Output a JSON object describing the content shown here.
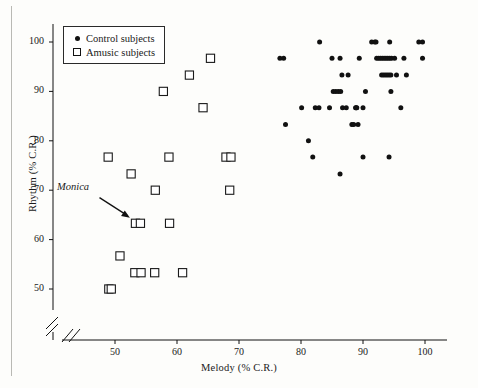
{
  "figure": {
    "background_color": "#fdfdfb",
    "ink_color": "#111111"
  },
  "legend": {
    "position": "top-left-inside",
    "entries": [
      {
        "marker": "filled-circle",
        "label": "Control subjects"
      },
      {
        "marker": "open-square",
        "label": "Amusic subjects"
      }
    ]
  },
  "annotation": {
    "text": "Monica",
    "style": "italic",
    "arrow": {
      "from_x": 47.5,
      "from_y": 68.5,
      "to_x": 52.4,
      "to_y": 64.4
    }
  },
  "chart_data": {
    "type": "scatter",
    "title": "",
    "xlabel": "Melody (% C.R.)",
    "ylabel": "Rhythm (% C.R.)",
    "xlim": [
      45.5,
      103.5
    ],
    "ylim": [
      46.5,
      102.5
    ],
    "xticks": [
      50,
      60,
      70,
      80,
      90,
      100
    ],
    "yticks": [
      50,
      60,
      70,
      80,
      90,
      100
    ],
    "grid": false,
    "axis_break": {
      "x": true,
      "y": true,
      "note": "double slash break near origin on both axes"
    },
    "legend_position": "upper left",
    "series": [
      {
        "name": "Amusic subjects",
        "marker": "open-square",
        "points": [
          [
            49.0,
            50.0
          ],
          [
            49.4,
            50.0
          ],
          [
            48.9,
            76.7
          ],
          [
            50.8,
            56.7
          ],
          [
            52.6,
            73.3
          ],
          [
            53.2,
            53.3
          ],
          [
            53.3,
            63.3
          ],
          [
            54.1,
            63.3
          ],
          [
            54.2,
            53.3
          ],
          [
            56.4,
            53.3
          ],
          [
            56.5,
            70.0
          ],
          [
            57.8,
            90.0
          ],
          [
            58.7,
            76.7
          ],
          [
            58.8,
            63.3
          ],
          [
            60.9,
            53.3
          ],
          [
            62.0,
            93.3
          ],
          [
            64.2,
            86.7
          ],
          [
            65.4,
            96.7
          ],
          [
            67.9,
            76.7
          ],
          [
            68.7,
            76.7
          ],
          [
            68.5,
            70.0
          ]
        ]
      },
      {
        "name": "Control subjects",
        "marker": "filled-circle",
        "points": [
          [
            76.6,
            96.7
          ],
          [
            77.2,
            96.7
          ],
          [
            77.5,
            83.3
          ],
          [
            80.1,
            86.7
          ],
          [
            81.2,
            80.0
          ],
          [
            81.9,
            76.7
          ],
          [
            82.3,
            86.7
          ],
          [
            82.9,
            86.7
          ],
          [
            83.0,
            100.0
          ],
          [
            84.6,
            86.7
          ],
          [
            85.0,
            96.7
          ],
          [
            85.2,
            90.0
          ],
          [
            85.6,
            90.0
          ],
          [
            86.0,
            90.0
          ],
          [
            86.3,
            96.7
          ],
          [
            86.4,
            90.0
          ],
          [
            86.3,
            73.3
          ],
          [
            86.6,
            93.3
          ],
          [
            86.7,
            86.7
          ],
          [
            87.3,
            86.7
          ],
          [
            87.6,
            93.3
          ],
          [
            88.2,
            83.3
          ],
          [
            88.5,
            83.3
          ],
          [
            88.8,
            86.7
          ],
          [
            88.9,
            86.7
          ],
          [
            89.0,
            86.7
          ],
          [
            89.2,
            83.3
          ],
          [
            89.4,
            96.7
          ],
          [
            90.0,
            86.7
          ],
          [
            90.0,
            76.7
          ],
          [
            90.4,
            90.0
          ],
          [
            91.4,
            100.0
          ],
          [
            91.9,
            100.0
          ],
          [
            92.1,
            100.0
          ],
          [
            92.2,
            96.7
          ],
          [
            92.5,
            96.7
          ],
          [
            92.8,
            96.7
          ],
          [
            93.0,
            93.3
          ],
          [
            93.1,
            96.7
          ],
          [
            93.3,
            93.3
          ],
          [
            93.4,
            96.7
          ],
          [
            93.6,
            93.3
          ],
          [
            93.7,
            96.7
          ],
          [
            93.9,
            93.3
          ],
          [
            94.0,
            96.7
          ],
          [
            94.2,
            93.3
          ],
          [
            94.3,
            96.7
          ],
          [
            94.5,
            93.3
          ],
          [
            94.6,
            96.7
          ],
          [
            94.2,
            76.7
          ],
          [
            94.3,
            100.0
          ],
          [
            94.5,
            90.0
          ],
          [
            95.1,
            96.7
          ],
          [
            95.4,
            93.3
          ],
          [
            96.1,
            86.7
          ],
          [
            96.6,
            96.7
          ],
          [
            97.0,
            93.3
          ],
          [
            99.0,
            100.0
          ],
          [
            99.6,
            100.0
          ],
          [
            99.6,
            96.7
          ]
        ]
      }
    ]
  }
}
